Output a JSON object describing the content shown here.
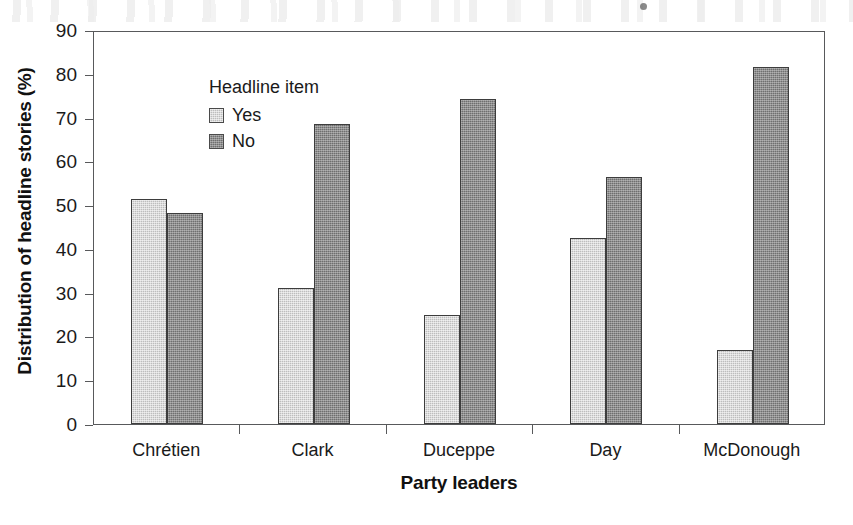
{
  "chart_data": {
    "type": "bar",
    "title": "",
    "xlabel": "Party leaders",
    "ylabel": "Distribution of headline stories (%)",
    "categories": [
      "Chrétien",
      "Clark",
      "Duceppe",
      "Day",
      "McDonough"
    ],
    "series": [
      {
        "name": "Yes",
        "color": "#bdbdbd",
        "values": [
          51.3,
          31.0,
          24.9,
          42.5,
          17.0
        ]
      },
      {
        "name": "No",
        "color": "#6f6f6f",
        "values": [
          48.3,
          68.6,
          74.3,
          56.4,
          81.5
        ]
      }
    ],
    "ylim": [
      0,
      90
    ],
    "ytick_step": 10,
    "yticks": [
      0,
      10,
      20,
      30,
      40,
      50,
      60,
      70,
      80,
      90
    ],
    "ytick_labels": [
      "0",
      "10",
      "20",
      "30",
      "40",
      "50",
      "60",
      "70",
      "80",
      "90"
    ],
    "grid": false,
    "legend": {
      "title": "Headline item",
      "position": "upper-left-inside",
      "entries": [
        "Yes",
        "No"
      ]
    },
    "frame": true,
    "orientation": "vertical",
    "grouping": "grouped"
  },
  "colors": {
    "series_yes": "#bdbdbd",
    "series_no": "#6f6f6f",
    "axis": "#58595b",
    "text": "#1a1a1a",
    "background": "#ffffff"
  }
}
